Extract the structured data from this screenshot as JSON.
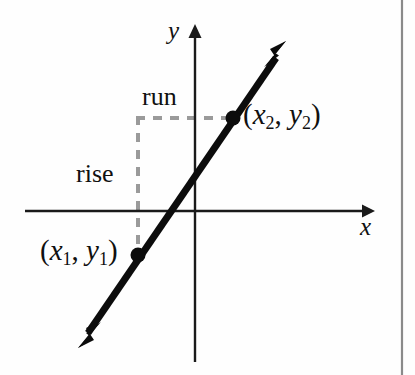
{
  "figure": {
    "kind": "coordinate-plane-slope-diagram",
    "background_color": "#fefefe",
    "border_color": "#8a8a8a",
    "axes": {
      "color": "#1a1a1a",
      "x_axis": {
        "label": "x",
        "y": 211,
        "x_start": 25,
        "x_end": 372
      },
      "y_axis": {
        "label": "y",
        "x": 195,
        "y_start": 25,
        "y_end": 362
      }
    },
    "line": {
      "color": "#0c0c0c",
      "stroke_width": 7,
      "arrow_start": {
        "x": 78,
        "y": 348
      },
      "arrow_end": {
        "x": 286,
        "y": 43
      },
      "description": "double-headed straight line with positive slope"
    },
    "points": [
      {
        "name": "point-1",
        "label": "(x1, y1)",
        "x": 138,
        "y": 255,
        "dot_radius": 7
      },
      {
        "name": "point-2",
        "label": "(x2, y2)",
        "x": 233,
        "y": 118,
        "dot_radius": 7
      }
    ],
    "guides": {
      "color": "#9a9a9a",
      "dash": "9 8",
      "stroke_width": 4,
      "vertical": {
        "x": 138,
        "y_top": 118,
        "y_bottom": 257
      },
      "horizontal": {
        "y": 118,
        "x_left": 136,
        "x_right": 233
      }
    },
    "labels": {
      "y_axis": "y",
      "x_axis": "x",
      "run": "run",
      "rise": "rise",
      "point1": {
        "open": "(",
        "var_x": "x",
        "sub_x": "1",
        "comma": ", ",
        "var_y": "y",
        "sub_y": "1",
        "close": ")"
      },
      "point2": {
        "open": "(",
        "var_x": "x",
        "sub_x": "2",
        "comma": ", ",
        "var_y": "y",
        "sub_y": "2",
        "close": ")"
      }
    }
  }
}
